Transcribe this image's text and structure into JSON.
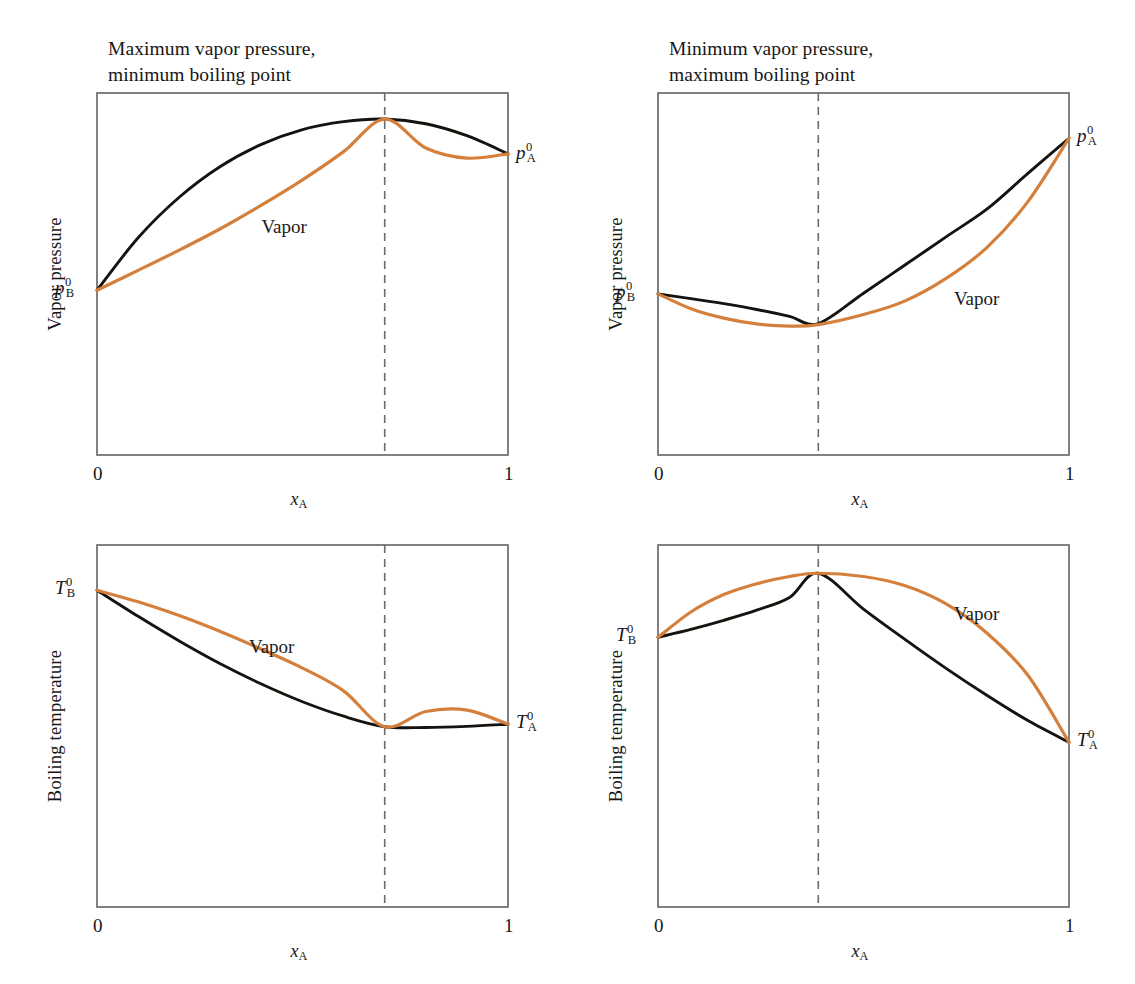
{
  "figure": {
    "title": "",
    "background": "#ffffff",
    "liquid_color": "#16130f",
    "vapor_color": "#d4803c",
    "axis_color": "#6b6b6b",
    "dash_color": "#6b6b6b"
  },
  "panels": [
    {
      "id": "top-left",
      "title": "Maximum vapor pressure,\nminimum boiling point",
      "ylabel": "Vapor pressure",
      "xlabel_main": "x",
      "xlabel_sub": "A",
      "tick_left": "0",
      "tick_right": "1",
      "vapor_label": "Vapor",
      "left_endpoint": {
        "symbol": "p",
        "sup": "0",
        "sub": "B"
      },
      "right_endpoint": {
        "symbol": "p",
        "sup": "0",
        "sub": "A"
      }
    },
    {
      "id": "top-right",
      "title": "Minimum vapor pressure,\nmaximum boiling point",
      "ylabel": "Vapor pressure",
      "xlabel_main": "x",
      "xlabel_sub": "A",
      "tick_left": "0",
      "tick_right": "1",
      "vapor_label": "Vapor",
      "left_endpoint": {
        "symbol": "p",
        "sup": "0",
        "sub": "B"
      },
      "right_endpoint": {
        "symbol": "p",
        "sup": "0",
        "sub": "A"
      }
    },
    {
      "id": "bottom-left",
      "title": "",
      "ylabel": "Boiling temperature",
      "xlabel_main": "x",
      "xlabel_sub": "A",
      "tick_left": "0",
      "tick_right": "1",
      "vapor_label": "Vapor",
      "left_endpoint": {
        "symbol": "T",
        "sup": "0",
        "sub": "B"
      },
      "right_endpoint": {
        "symbol": "T",
        "sup": "0",
        "sub": "A"
      }
    },
    {
      "id": "bottom-right",
      "title": "",
      "ylabel": "Boiling temperature",
      "xlabel_main": "x",
      "xlabel_sub": "A",
      "tick_left": "0",
      "tick_right": "1",
      "vapor_label": "Vapor",
      "left_endpoint": {
        "symbol": "T",
        "sup": "0",
        "sub": "B"
      },
      "right_endpoint": {
        "symbol": "T",
        "sup": "0",
        "sub": "A"
      }
    }
  ],
  "chart_data": [
    {
      "type": "line",
      "panel": "top-left",
      "title": "Maximum vapor pressure, minimum boiling point",
      "xlabel": "x_A",
      "ylabel": "Vapor pressure",
      "xlim": [
        0,
        1
      ],
      "ylim": [
        0,
        1
      ],
      "xticks": [
        0,
        1
      ],
      "xticklabels": [
        "0",
        "1"
      ],
      "grid": false,
      "legend": "inline",
      "annotations": [
        {
          "text": "Vapor",
          "x": 0.4,
          "y": 0.66
        },
        {
          "text": "p0_B",
          "x": 0.0,
          "y": 0.455
        },
        {
          "text": "p0_A",
          "x": 1.0,
          "y": 0.83
        }
      ],
      "azeotrope_x": 0.7,
      "series": [
        {
          "name": "Liquid",
          "color": "#16130f",
          "x": [
            0.0,
            0.1,
            0.2,
            0.3,
            0.4,
            0.5,
            0.6,
            0.7,
            0.8,
            0.9,
            1.0
          ],
          "values": [
            0.455,
            0.6,
            0.712,
            0.797,
            0.858,
            0.899,
            0.921,
            0.928,
            0.915,
            0.882,
            0.832
          ]
        },
        {
          "name": "Vapor",
          "color": "#d4803c",
          "x": [
            0.0,
            0.1,
            0.2,
            0.3,
            0.4,
            0.5,
            0.6,
            0.7,
            0.8,
            0.9,
            1.0
          ],
          "values": [
            0.455,
            0.51,
            0.566,
            0.625,
            0.69,
            0.76,
            0.838,
            0.928,
            0.848,
            0.82,
            0.832
          ]
        }
      ]
    },
    {
      "type": "line",
      "panel": "top-right",
      "title": "Minimum vapor pressure, maximum boiling point",
      "xlabel": "x_A",
      "ylabel": "Vapor pressure",
      "xlim": [
        0,
        1
      ],
      "ylim": [
        0,
        1
      ],
      "xticks": [
        0,
        1
      ],
      "xticklabels": [
        "0",
        "1"
      ],
      "grid": false,
      "legend": "inline",
      "annotations": [
        {
          "text": "Vapor",
          "x": 0.72,
          "y": 0.46
        },
        {
          "text": "p0_B",
          "x": 0.0,
          "y": 0.445
        },
        {
          "text": "p0_A",
          "x": 1.0,
          "y": 0.875
        }
      ],
      "azeotrope_x": 0.39,
      "series": [
        {
          "name": "Liquid",
          "color": "#16130f",
          "x": [
            0.0,
            0.08,
            0.16,
            0.24,
            0.32,
            0.39,
            0.5,
            0.6,
            0.7,
            0.8,
            0.9,
            1.0
          ],
          "values": [
            0.445,
            0.432,
            0.418,
            0.402,
            0.383,
            0.363,
            0.447,
            0.524,
            0.602,
            0.679,
            0.778,
            0.875
          ]
        },
        {
          "name": "Vapor",
          "color": "#d4803c",
          "x": [
            0.0,
            0.08,
            0.16,
            0.24,
            0.32,
            0.39,
            0.5,
            0.6,
            0.7,
            0.8,
            0.9,
            1.0
          ],
          "values": [
            0.445,
            0.404,
            0.378,
            0.362,
            0.356,
            0.36,
            0.388,
            0.425,
            0.487,
            0.573,
            0.7,
            0.875
          ]
        }
      ]
    },
    {
      "type": "line",
      "panel": "bottom-left",
      "title": "Boiling temperature, minimum boiling azeotrope",
      "xlabel": "x_A",
      "ylabel": "Boiling temperature",
      "xlim": [
        0,
        1
      ],
      "ylim": [
        0,
        1
      ],
      "xticks": [
        0,
        1
      ],
      "xticklabels": [
        "0",
        "1"
      ],
      "grid": false,
      "legend": "inline",
      "annotations": [
        {
          "text": "Vapor",
          "x": 0.37,
          "y": 0.75
        },
        {
          "text": "T0_B",
          "x": 0.0,
          "y": 0.875
        },
        {
          "text": "T0_A",
          "x": 1.0,
          "y": 0.505
        }
      ],
      "azeotrope_x": 0.7,
      "series": [
        {
          "name": "Liquid",
          "color": "#16130f",
          "x": [
            0.0,
            0.1,
            0.2,
            0.3,
            0.4,
            0.5,
            0.6,
            0.7,
            0.8,
            0.9,
            1.0
          ],
          "values": [
            0.875,
            0.803,
            0.735,
            0.672,
            0.616,
            0.567,
            0.527,
            0.498,
            0.496,
            0.499,
            0.505
          ]
        },
        {
          "name": "Vapor",
          "color": "#d4803c",
          "x": [
            0.0,
            0.1,
            0.2,
            0.3,
            0.4,
            0.5,
            0.6,
            0.7,
            0.8,
            0.9,
            1.0
          ],
          "values": [
            0.875,
            0.843,
            0.805,
            0.761,
            0.712,
            0.66,
            0.597,
            0.498,
            0.54,
            0.544,
            0.505
          ]
        }
      ]
    },
    {
      "type": "line",
      "panel": "bottom-right",
      "title": "Boiling temperature, maximum boiling azeotrope",
      "xlabel": "x_A",
      "ylabel": "Boiling temperature",
      "xlim": [
        0,
        1
      ],
      "ylim": [
        0,
        1
      ],
      "xticks": [
        0,
        1
      ],
      "xticklabels": [
        "0",
        "1"
      ],
      "grid": false,
      "legend": "inline",
      "annotations": [
        {
          "text": "Vapor",
          "x": 0.72,
          "y": 0.84
        },
        {
          "text": "T0_B",
          "x": 0.0,
          "y": 0.745
        },
        {
          "text": "T0_A",
          "x": 1.0,
          "y": 0.455
        }
      ],
      "azeotrope_x": 0.39,
      "series": [
        {
          "name": "Liquid",
          "color": "#16130f",
          "x": [
            0.0,
            0.08,
            0.16,
            0.24,
            0.32,
            0.39,
            0.5,
            0.6,
            0.7,
            0.8,
            0.9,
            1.0
          ],
          "values": [
            0.745,
            0.767,
            0.792,
            0.82,
            0.855,
            0.922,
            0.823,
            0.74,
            0.66,
            0.585,
            0.515,
            0.455
          ]
        },
        {
          "name": "Vapor",
          "color": "#d4803c",
          "x": [
            0.0,
            0.08,
            0.16,
            0.24,
            0.32,
            0.39,
            0.5,
            0.6,
            0.7,
            0.8,
            0.9,
            1.0
          ],
          "values": [
            0.745,
            0.815,
            0.863,
            0.893,
            0.913,
            0.922,
            0.913,
            0.888,
            0.838,
            0.757,
            0.64,
            0.455
          ]
        }
      ]
    }
  ]
}
